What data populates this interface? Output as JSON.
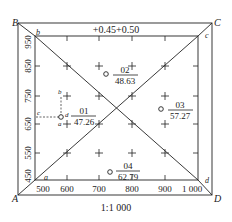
{
  "diagram": {
    "title_top": "+0.45+0.50",
    "scale": "1:1 000",
    "outer_corners": {
      "A": "A",
      "B": "B",
      "C": "C",
      "D": "D"
    },
    "inner_corners": {
      "a": "a",
      "b": "b",
      "c": "c",
      "d": "d"
    },
    "x_ticks": [
      "500",
      "600",
      "700",
      "800",
      "900",
      "1 000"
    ],
    "y_ticks": [
      "950",
      "850",
      "750",
      "650",
      "550",
      "450"
    ],
    "points": [
      {
        "id": "01",
        "elevation": "47.26"
      },
      {
        "id": "02",
        "elevation": "48.63"
      },
      {
        "id": "03",
        "elevation": "57.27"
      },
      {
        "id": "04",
        "elevation": "62.79"
      }
    ],
    "point01_labels": {
      "a": "a",
      "b": "b",
      "c": "c",
      "d": "d"
    }
  }
}
